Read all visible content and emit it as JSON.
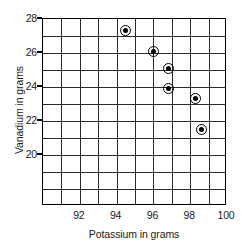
{
  "chart_data": {
    "type": "scatter",
    "title": "",
    "xlabel": "Potassium in grams",
    "ylabel": "Vanadium in grams",
    "xlim": [
      90,
      100
    ],
    "ylim": [
      17,
      28
    ],
    "xticks": [
      92,
      94,
      96,
      98,
      100
    ],
    "yticks": [
      28,
      26,
      24,
      22,
      20
    ],
    "xtick_labels": [
      "92",
      "94",
      "96",
      "98",
      "100"
    ],
    "ytick_labels": [
      "28",
      "26",
      "24",
      "22",
      "20"
    ],
    "grid": true,
    "grid_x_step": 1,
    "grid_y_step": 1,
    "legend": "none",
    "marker": "circle-with-dot",
    "points": [
      {
        "x": 94.5,
        "y": 27.3
      },
      {
        "x": 96.0,
        "y": 26.1
      },
      {
        "x": 96.8,
        "y": 25.1
      },
      {
        "x": 96.8,
        "y": 23.9
      },
      {
        "x": 98.3,
        "y": 23.3
      },
      {
        "x": 98.6,
        "y": 21.5
      }
    ],
    "colors": {
      "marker": "#000000",
      "grid": "#2a2a2a",
      "frame": "#000000",
      "background": "#ffffff"
    }
  }
}
